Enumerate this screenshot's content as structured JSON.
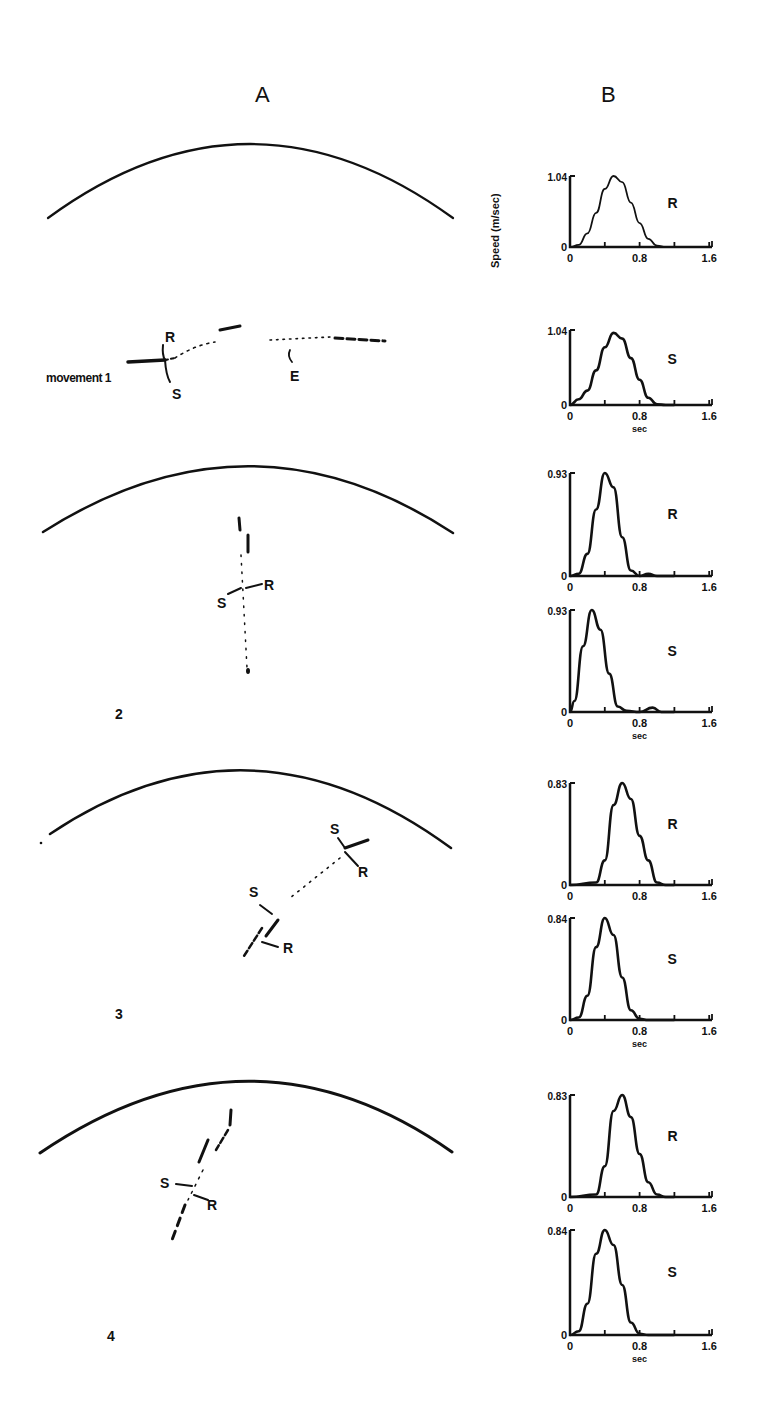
{
  "figure": {
    "panel_a_label": "A",
    "panel_b_label": "B",
    "y_axis_label": "Speed (m/sec)",
    "x_axis_unit": "sec",
    "ink_color": "#111111",
    "background": "#ffffff"
  },
  "movements": [
    {
      "label": "movement 1",
      "number_label": "",
      "annotations": [
        "R",
        "S",
        "E"
      ]
    },
    {
      "label": "",
      "number_label": "2",
      "annotations": [
        "S",
        "R"
      ]
    },
    {
      "label": "",
      "number_label": "3",
      "annotations": [
        "S",
        "R",
        "S",
        "R"
      ]
    },
    {
      "label": "",
      "number_label": "4",
      "annotations": [
        "S",
        "R"
      ]
    }
  ],
  "chart_data": [
    {
      "type": "line",
      "movement": 1,
      "series_label": "R",
      "title": "",
      "xlabel": "",
      "ylabel": "Speed (m/sec)",
      "xlim": [
        0,
        2.0
      ],
      "ylim": [
        0,
        1.04
      ],
      "xticks": [
        "0",
        "0.8",
        "1.6"
      ],
      "yticks": [
        "0",
        "1.04"
      ],
      "x": [
        0,
        0.1,
        0.2,
        0.3,
        0.4,
        0.5,
        0.6,
        0.7,
        0.8,
        0.9,
        1.0,
        1.1,
        1.2
      ],
      "values": [
        0,
        0.03,
        0.2,
        0.5,
        0.85,
        1.04,
        0.95,
        0.65,
        0.35,
        0.12,
        0.02,
        0,
        0
      ]
    },
    {
      "type": "line",
      "movement": 1,
      "series_label": "S",
      "xlabel": "sec",
      "ylabel": "",
      "xlim": [
        0,
        2.0
      ],
      "ylim": [
        0,
        1.04
      ],
      "xticks": [
        "0",
        "0.8",
        "1.6"
      ],
      "yticks": [
        "0",
        "1.04"
      ],
      "x": [
        0,
        0.1,
        0.2,
        0.3,
        0.4,
        0.5,
        0.6,
        0.7,
        0.8,
        0.9,
        1.0,
        1.1,
        1.2
      ],
      "values": [
        0,
        0.08,
        0.2,
        0.48,
        0.8,
        1.0,
        0.92,
        0.65,
        0.35,
        0.1,
        0.01,
        0,
        0
      ]
    },
    {
      "type": "line",
      "movement": 2,
      "series_label": "R",
      "xlabel": "",
      "ylabel": "",
      "xlim": [
        0,
        2.0
      ],
      "ylim": [
        0,
        0.93
      ],
      "xticks": [
        "0",
        "0.8",
        "1.6"
      ],
      "yticks": [
        "0",
        "0.93"
      ],
      "x": [
        0,
        0.1,
        0.2,
        0.3,
        0.4,
        0.5,
        0.6,
        0.7,
        0.8,
        0.9,
        1.0,
        1.2
      ],
      "values": [
        0,
        0.02,
        0.2,
        0.6,
        0.93,
        0.8,
        0.35,
        0.05,
        0,
        0.02,
        0,
        0
      ]
    },
    {
      "type": "line",
      "movement": 2,
      "series_label": "S",
      "xlabel": "sec",
      "ylabel": "",
      "xlim": [
        0,
        2.0
      ],
      "ylim": [
        0,
        0.93
      ],
      "xticks": [
        "0",
        "0.8",
        "1.6"
      ],
      "yticks": [
        "0",
        "0.93"
      ],
      "x": [
        0,
        0.05,
        0.15,
        0.25,
        0.35,
        0.45,
        0.55,
        0.65,
        0.8,
        0.95,
        1.05,
        1.2
      ],
      "values": [
        0,
        0.1,
        0.6,
        0.93,
        0.75,
        0.35,
        0.05,
        0.01,
        0,
        0.04,
        0,
        0
      ]
    },
    {
      "type": "line",
      "movement": 3,
      "series_label": "R",
      "xlabel": "",
      "ylabel": "",
      "xlim": [
        0,
        2.0
      ],
      "ylim": [
        0,
        0.83
      ],
      "xticks": [
        "0",
        "0.8",
        "1.6"
      ],
      "yticks": [
        "0",
        "0.83"
      ],
      "x": [
        0,
        0.3,
        0.4,
        0.5,
        0.6,
        0.7,
        0.8,
        0.9,
        1.0,
        1.1,
        1.2
      ],
      "values": [
        0,
        0.02,
        0.2,
        0.65,
        0.83,
        0.7,
        0.4,
        0.2,
        0.02,
        0,
        0
      ]
    },
    {
      "type": "line",
      "movement": 3,
      "series_label": "S",
      "xlabel": "sec",
      "ylabel": "",
      "xlim": [
        0,
        2.0
      ],
      "ylim": [
        0,
        0.84
      ],
      "xticks": [
        "0",
        "0.8",
        "1.6"
      ],
      "yticks": [
        "0",
        "0.84"
      ],
      "x": [
        0,
        0.1,
        0.2,
        0.3,
        0.4,
        0.5,
        0.6,
        0.7,
        0.8,
        0.9,
        1.2
      ],
      "values": [
        0,
        0.02,
        0.2,
        0.6,
        0.84,
        0.7,
        0.35,
        0.08,
        0.01,
        0,
        0
      ]
    },
    {
      "type": "line",
      "movement": 4,
      "series_label": "R",
      "xlabel": "",
      "ylabel": "",
      "xlim": [
        0,
        2.0
      ],
      "ylim": [
        0,
        0.83
      ],
      "xticks": [
        "0",
        "0.8",
        "1.6"
      ],
      "yticks": [
        "0",
        "0.83"
      ],
      "x": [
        0,
        0.3,
        0.4,
        0.5,
        0.6,
        0.7,
        0.8,
        0.9,
        1.0,
        1.1,
        1.2
      ],
      "values": [
        0,
        0.02,
        0.25,
        0.7,
        0.83,
        0.65,
        0.35,
        0.12,
        0.02,
        0,
        0
      ]
    },
    {
      "type": "line",
      "movement": 4,
      "series_label": "S",
      "xlabel": "sec",
      "ylabel": "",
      "xlim": [
        0,
        2.0
      ],
      "ylim": [
        0,
        0.84
      ],
      "xticks": [
        "0",
        "0.8",
        "1.6"
      ],
      "yticks": [
        "0",
        "0.84"
      ],
      "x": [
        0,
        0.1,
        0.2,
        0.3,
        0.4,
        0.5,
        0.6,
        0.7,
        0.8,
        0.9,
        1.2
      ],
      "values": [
        0,
        0.03,
        0.25,
        0.65,
        0.84,
        0.72,
        0.4,
        0.1,
        0.01,
        0,
        0
      ]
    }
  ]
}
